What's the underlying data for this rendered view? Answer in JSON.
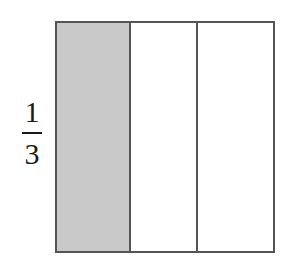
{
  "fraction": {
    "numerator": "1",
    "denominator": "3"
  },
  "diagram": {
    "parts": 3,
    "shaded_parts": 1,
    "shade_color": "#c9c9c9",
    "border_color": "#555555"
  }
}
